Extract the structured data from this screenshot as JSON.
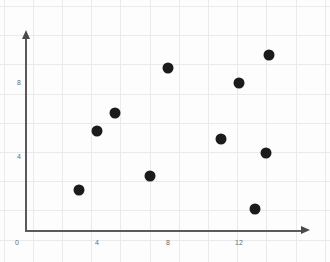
{
  "chart_data": {
    "type": "scatter",
    "title": "",
    "xlabel": "",
    "ylabel": "",
    "xlim": [
      0,
      16
    ],
    "ylim": [
      0,
      11
    ],
    "xticks": [
      0,
      4,
      8,
      12
    ],
    "yticks": [
      0,
      4,
      8
    ],
    "xtick_labels": [
      "0",
      "4",
      "8",
      "12"
    ],
    "ytick_labels": [
      "0",
      "4",
      "8"
    ],
    "grid": true,
    "legend": null,
    "marker": {
      "shape": "circle",
      "color": "#1b1b1b",
      "size_px": 11
    },
    "points": [
      {
        "x": 3,
        "y": 2.2
      },
      {
        "x": 4,
        "y": 5.4
      },
      {
        "x": 5,
        "y": 6.4
      },
      {
        "x": 7,
        "y": 3.0
      },
      {
        "x": 8,
        "y": 8.8
      },
      {
        "x": 11,
        "y": 5.0
      },
      {
        "x": 12,
        "y": 8.0
      },
      {
        "x": 12.9,
        "y": 1.2
      },
      {
        "x": 13.5,
        "y": 4.2
      },
      {
        "x": 13.7,
        "y": 9.5
      }
    ]
  },
  "axes": {
    "origin_label": "0",
    "y_axis_name": "y-axis",
    "x_axis_name": "x-axis"
  }
}
